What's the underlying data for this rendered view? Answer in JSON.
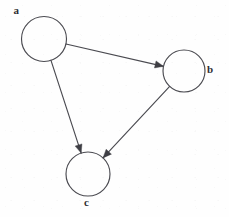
{
  "figure": {
    "background_color": "#fefefe",
    "stroke_color": "#4a4a50",
    "label_color": "#2e2e33",
    "width": 229,
    "height": 217
  },
  "chart_data": {
    "type": "diagram",
    "diagram_kind": "directed-graph",
    "title": "",
    "nodes": [
      {
        "id": "a",
        "label": "a",
        "cx": 44,
        "cy": 39,
        "r": 22.5,
        "label_position": "top-left"
      },
      {
        "id": "b",
        "label": "b",
        "cx": 184,
        "cy": 71,
        "r": 21.0,
        "label_position": "right"
      },
      {
        "id": "c",
        "label": "c",
        "cx": 88,
        "cy": 174,
        "r": 22.0,
        "label_position": "bottom"
      }
    ],
    "edges": [
      {
        "from": "a",
        "to": "b",
        "directed": true,
        "label": ""
      },
      {
        "from": "a",
        "to": "c",
        "directed": true,
        "label": ""
      },
      {
        "from": "b",
        "to": "c",
        "directed": true,
        "label": ""
      }
    ],
    "node_count": 3,
    "edge_count": 3,
    "legend": [],
    "annotations": []
  },
  "labels": {
    "a": "a",
    "b": "b",
    "c": "c"
  }
}
